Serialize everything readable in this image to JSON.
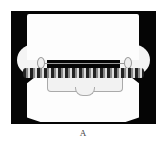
{
  "figure": {
    "image_description": "Dental cast model with orthodontic appliance, frontal view",
    "panel_label": "A"
  }
}
